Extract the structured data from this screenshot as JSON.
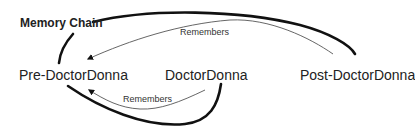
{
  "diagram": {
    "title": "Memory Chain",
    "nodes": [
      {
        "id": "pre",
        "label": "Pre-DoctorDonna"
      },
      {
        "id": "doctor",
        "label": "DoctorDonna"
      },
      {
        "id": "post",
        "label": "Post-DoctorDonna"
      }
    ],
    "edges": [
      {
        "from": "post",
        "to": "pre",
        "label": "Remembers"
      },
      {
        "from": "doctor",
        "to": "pre",
        "label": "Remembers"
      }
    ],
    "colors": {
      "stroke": "#111111",
      "arrow": "#555555",
      "text": "#222222",
      "background": "#ffffff"
    }
  }
}
